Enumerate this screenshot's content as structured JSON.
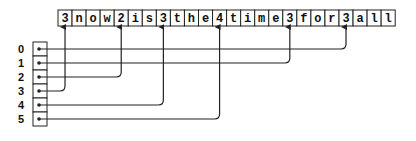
{
  "diagram": {
    "string_cells": [
      "3",
      "n",
      "o",
      "w",
      "2",
      "i",
      "s",
      "3",
      "t",
      "h",
      "e",
      "4",
      "t",
      "i",
      "m",
      "e",
      "3",
      "f",
      "o",
      "r",
      "3",
      "a",
      "l",
      "l"
    ],
    "pointer_indices": [
      "0",
      "1",
      "2",
      "3",
      "4",
      "5"
    ],
    "pointer_targets": [
      20,
      16,
      4,
      0,
      7,
      11
    ],
    "line_color": "#222222"
  }
}
